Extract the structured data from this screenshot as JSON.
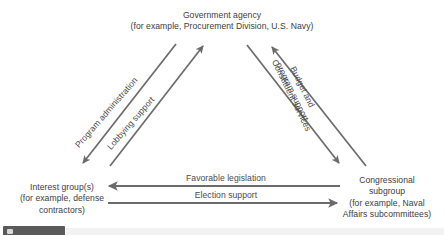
{
  "diagram": {
    "colors": {
      "line": "#6b6b6b",
      "text": "#3d3d3d",
      "edge_label_text": "#4a4a4a",
      "background": "#ffffff",
      "chip": "#5a5a5a"
    },
    "nodes": [
      {
        "id": "government-agency",
        "lines": [
          "Government agency",
          "(for example, Procurement Division, U.S. Navy)"
        ]
      },
      {
        "id": "interest-group",
        "lines": [
          "Interest group(s)",
          "(for example, defense",
          "contractors)"
        ]
      },
      {
        "id": "congressional-subgroup",
        "lines": [
          "Congressional",
          "subgroup",
          "(for example, Naval",
          "Affairs subcommittees)"
        ]
      }
    ],
    "edges": [
      {
        "id": "program-administration",
        "label_lines": [
          "Program administration"
        ],
        "from": "government-agency",
        "to": "interest-group",
        "direction": "down-left"
      },
      {
        "id": "lobbying-support",
        "label_lines": [
          "Lobbying support"
        ],
        "from": "interest-group",
        "to": "government-agency",
        "direction": "up-right"
      },
      {
        "id": "budget-and-program-support",
        "label_lines": [
          "Budget and",
          "program support"
        ],
        "from": "congressional-subgroup",
        "to": "government-agency",
        "direction": "up-left"
      },
      {
        "id": "constituent-services",
        "label_lines": [
          "Constituent services"
        ],
        "from": "government-agency",
        "to": "congressional-subgroup",
        "direction": "down-right"
      },
      {
        "id": "favorable-legislation",
        "label_lines": [
          "Favorable legislation"
        ],
        "from": "congressional-subgroup",
        "to": "interest-group",
        "direction": "left"
      },
      {
        "id": "election-support",
        "label_lines": [
          "Election support"
        ],
        "from": "interest-group",
        "to": "congressional-subgroup",
        "direction": "right"
      }
    ]
  }
}
